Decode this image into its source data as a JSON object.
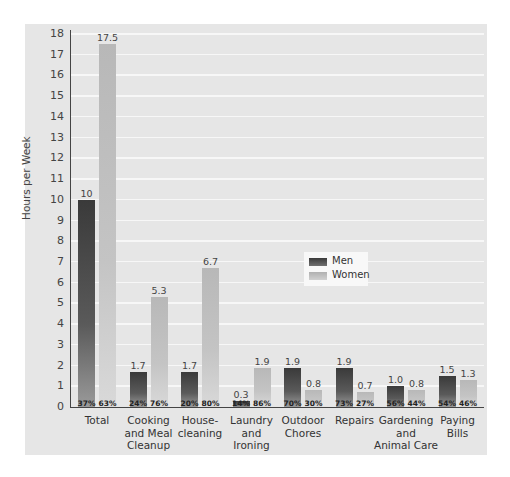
{
  "chart_data": {
    "type": "bar",
    "title": "",
    "xlabel": "",
    "ylabel": "Hours per Week",
    "ylim": [
      0,
      18
    ],
    "yticks": [
      0,
      1,
      2,
      3,
      4,
      5,
      6,
      7,
      8,
      9,
      10,
      11,
      12,
      13,
      14,
      15,
      16,
      17,
      18
    ],
    "grid": true,
    "legend_position": "center-right",
    "categories": [
      "Total",
      "Cooking and Meal Cleanup",
      "House-cleaning",
      "Laundry and Ironing",
      "Outdoor Chores",
      "Repairs",
      "Gardening and Animal Care",
      "Paying Bills"
    ],
    "series": [
      {
        "name": "Men",
        "color": "#4a4a4a",
        "values": [
          10,
          1.7,
          1.7,
          0.3,
          1.9,
          1.9,
          1.0,
          1.5
        ],
        "value_labels": [
          "10",
          "1.7",
          "1.7",
          "0.3",
          "1.9",
          "1.9",
          "1.0",
          "1.5"
        ],
        "share_labels": [
          "37%",
          "24%",
          "20%",
          "14%",
          "70%",
          "73%",
          "56%",
          "54%"
        ]
      },
      {
        "name": "Women",
        "color": "#c0c0c0",
        "values": [
          17.5,
          5.3,
          6.7,
          1.9,
          0.8,
          0.7,
          0.8,
          1.3
        ],
        "value_labels": [
          "17.5",
          "5.3",
          "6.7",
          "1.9",
          "0.8",
          "0.7",
          "0.8",
          "1.3"
        ],
        "share_labels": [
          "63%",
          "76%",
          "80%",
          "86%",
          "30%",
          "27%",
          "44%",
          "46%"
        ]
      }
    ]
  },
  "axis": {
    "ylabel": "Hours per Week",
    "ticks": [
      "0",
      "1",
      "2",
      "3",
      "4",
      "5",
      "6",
      "7",
      "8",
      "9",
      "10",
      "11",
      "12",
      "13",
      "14",
      "15",
      "16",
      "17",
      "18"
    ]
  },
  "categories_display": [
    "Total",
    "Cooking\nand Meal\nCleanup",
    "House-\ncleaning",
    "Laundry\nand\nIroning",
    "Outdoor\nChores",
    "Repairs",
    "Gardening\nand\nAnimal Care",
    "Paying\nBills"
  ],
  "legend": {
    "men": "Men",
    "women": "Women"
  }
}
